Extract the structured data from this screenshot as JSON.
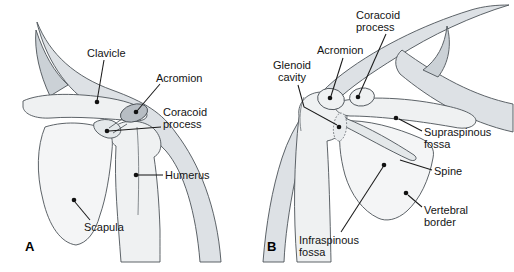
{
  "diagram": {
    "title_hint": "Shoulder girdle anatomy, anterior (A) and posterior (B) views",
    "panel_a": {
      "letter": "A",
      "labels": {
        "clavicle": "Clavicle",
        "acromion": "Acromion",
        "coracoid_line1": "Coracoid",
        "coracoid_line2": "process",
        "humerus": "Humerus",
        "scapula": "Scapula"
      }
    },
    "panel_b": {
      "letter": "B",
      "labels": {
        "coracoid_line1": "Coracoid",
        "coracoid_line2": "process",
        "acromion": "Acromion",
        "glenoid_line1": "Glenoid",
        "glenoid_line2": "cavity",
        "supraspinous_line1": "Supraspinous",
        "supraspinous_line2": "fossa",
        "spine": "Spine",
        "vertebral_line1": "Vertebral",
        "vertebral_line2": "border",
        "infraspinous_line1": "Infraspinous",
        "infraspinous_line2": "fossa"
      }
    },
    "colors": {
      "background": "#ffffff",
      "silhouette_fill": "#dde1e5",
      "silhouette_dark": "#cbd1d6",
      "bone_fill": "#eff1f2",
      "bone_fill_light": "#f4f5f6",
      "ridge_fill": "#e4e8ea",
      "glenoid_fill": "#e9ecee",
      "acromion_fill": "#b7bdc3",
      "text_color": "#141414",
      "leader_color": "#1a1a1a"
    }
  }
}
